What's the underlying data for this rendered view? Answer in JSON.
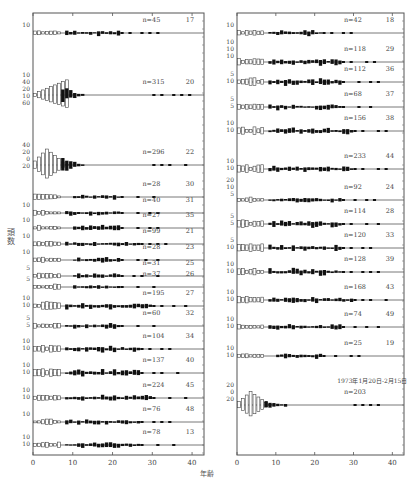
{
  "figure": {
    "ylabel": "頭数",
    "xlabel": "年齢",
    "note": "1973年1月20日-2月15日"
  },
  "chart_data": {
    "type": "bar",
    "subtype": "back-to-back age histograms (sex-split, open bars = young/immature, filled bars = adult)",
    "xlabel": "年齢",
    "ylabel": "頭数",
    "xlim": [
      0,
      43
    ],
    "xticks": [
      0,
      10,
      20,
      30,
      40
    ],
    "columns": [
      {
        "name": "left",
        "panels": [
          {
            "id": "17",
            "n": 45,
            "yticks": [
              "10"
            ]
          },
          {
            "id": "20",
            "n": 315,
            "yticks": [
              "10",
              "40",
              "20",
              "10",
              "60"
            ],
            "peak_age": 8,
            "peak_value": 55
          },
          {
            "id": "22",
            "n": 296,
            "yticks": [
              "40",
              "20",
              "0",
              "20"
            ],
            "peak_age": 3,
            "peak_value": 58
          },
          {
            "id": "30",
            "n": 28,
            "yticks": []
          },
          {
            "id": "31",
            "n": 40,
            "yticks": [
              "10"
            ]
          },
          {
            "id": "35",
            "n": 27,
            "yticks": [
              "10"
            ]
          },
          {
            "id": "21",
            "n": 99,
            "yticks": [
              "10"
            ]
          },
          {
            "id": "23",
            "n": 28,
            "yticks": [
              "10"
            ]
          },
          {
            "id": "25",
            "n": 31,
            "yticks": [
              "5"
            ]
          },
          {
            "id": "26",
            "n": 37,
            "yticks": [
              "5"
            ]
          },
          {
            "id": "27",
            "n": 195,
            "yticks": [
              "10",
              "10"
            ]
          },
          {
            "id": "32",
            "n": 60,
            "yticks": [
              "5",
              "5"
            ]
          },
          {
            "id": "34",
            "n": 104,
            "yticks": [
              "10",
              "10"
            ]
          },
          {
            "id": "40",
            "n": 137,
            "yticks": [
              "10",
              "10"
            ]
          },
          {
            "id": "45",
            "n": 224,
            "yticks": [
              "10",
              "10"
            ]
          },
          {
            "id": "48",
            "n": 76,
            "yticks": [
              "10"
            ]
          },
          {
            "id": "13",
            "n": 78,
            "yticks": [
              "10",
              "10"
            ]
          }
        ]
      },
      {
        "name": "right",
        "panels": [
          {
            "id": "18",
            "n": 42,
            "yticks": [
              "10"
            ]
          },
          {
            "id": "29",
            "n": 118,
            "yticks": [
              "10",
              "10",
              "10"
            ]
          },
          {
            "id": "36",
            "n": 112,
            "yticks": [
              "5",
              "10"
            ]
          },
          {
            "id": "37",
            "n": 68,
            "yticks": [
              "5",
              "5"
            ]
          },
          {
            "id": "38",
            "n": 156,
            "yticks": [
              "10",
              "10"
            ]
          },
          {
            "id": "44",
            "n": 233,
            "yticks": [
              "10",
              "10"
            ]
          },
          {
            "id": "24",
            "n": 92,
            "yticks": [
              "20",
              "10",
              "5"
            ]
          },
          {
            "id": "28",
            "n": 114,
            "yticks": [
              "5",
              "5"
            ]
          },
          {
            "id": "33",
            "n": 120,
            "yticks": [
              "5",
              "10"
            ]
          },
          {
            "id": "39",
            "n": 128,
            "yticks": [
              "10",
              "10"
            ]
          },
          {
            "id": "43",
            "n": 168,
            "yticks": [
              "10",
              "10"
            ]
          },
          {
            "id": "49",
            "n": 74,
            "yticks": [
              "10",
              "10"
            ]
          },
          {
            "id": "19",
            "n": 25,
            "yticks": [
              "10",
              "10"
            ]
          },
          {
            "id": "total",
            "n": 203,
            "yticks": [
              "20",
              "0",
              "20"
            ],
            "annotation": "1973年1月20日-2月15日",
            "peak_age": 3,
            "peak_value": 22
          }
        ]
      }
    ],
    "grid": false,
    "legend": null
  }
}
